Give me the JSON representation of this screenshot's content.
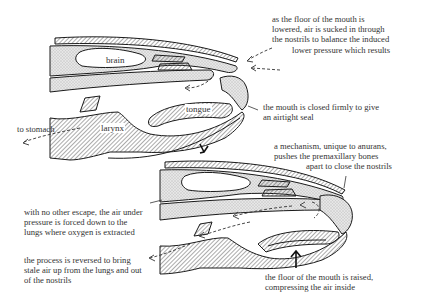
{
  "diagram": {
    "top_figure": {
      "parts": {
        "brain": "brain",
        "tongue": "tongue",
        "larynx": "larynx"
      },
      "annotations": {
        "to_stomach": "to stomach",
        "floor_lowered": [
          "as the floor of the mouth is",
          "lowered, air is sucked in through",
          "the nostrils to balance the induced",
          "lower pressure which results"
        ],
        "mouth_closed": [
          "the mouth is closed firmly to give",
          "an airtight seal"
        ]
      }
    },
    "bottom_figure": {
      "annotations": {
        "mechanism": [
          "a mechanism, unique to anurans,",
          "pushes the premaxillary bones",
          "apart to close the nostrils"
        ],
        "air_forced": [
          "with no other escape, the air under",
          "pressure is forced down to the",
          "lungs where oxygen is extracted"
        ],
        "reversed": [
          "the process is reversed to bring",
          "stale air up from the lungs and out",
          "of the nostrils"
        ],
        "floor_raised": [
          "the floor of the mouth is raised,",
          "compressing the air inside"
        ]
      }
    },
    "colors": {
      "ink": "#1a1a1a",
      "stipple": "#d9d9d9",
      "hatch": "#555555",
      "background": "#ffffff"
    }
  }
}
